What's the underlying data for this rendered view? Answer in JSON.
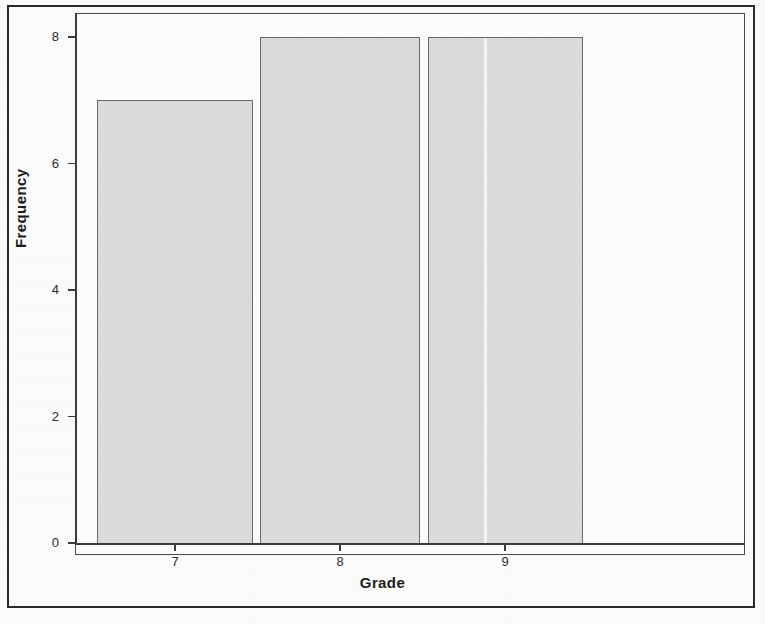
{
  "chart_data": {
    "type": "bar",
    "title": "",
    "subtitle": "",
    "xlabel": "Grade",
    "ylabel": "Frequency",
    "categories": [
      "7",
      "8",
      "9"
    ],
    "values": [
      7,
      8,
      8
    ],
    "series": [
      {
        "name": "Frequency",
        "values": [
          7,
          8,
          8
        ]
      }
    ],
    "ylim": [
      0,
      8.4
    ],
    "xlim": [
      6.5,
      9.5
    ],
    "y_ticks": [
      0,
      2,
      4,
      6,
      8
    ],
    "y_tick_labels": [
      "0",
      "2",
      "4",
      "6",
      "8"
    ],
    "x_ticks": [
      7,
      8,
      9
    ],
    "x_tick_labels": [
      "7",
      "8",
      "9"
    ],
    "grid": false,
    "legend": "none",
    "bar_fill_color": "#e3e3e3",
    "bar_edge_color": "#6a6a6a",
    "axis_color": "#3c3c3c",
    "frame_color": "#2a2a2a",
    "background_color": "#ffffff"
  },
  "figure": {
    "outer_border": true,
    "plot_border": true
  }
}
